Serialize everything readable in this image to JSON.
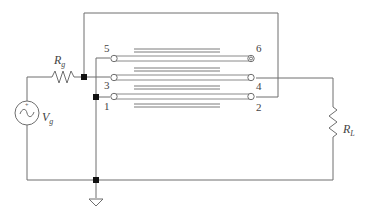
{
  "diagram": {
    "type": "transmission-line transformer circuit",
    "source": {
      "label": "V",
      "subscript": "g",
      "symbol": "ac-voltage-source"
    },
    "source_resistor": {
      "label": "R",
      "subscript": "g"
    },
    "load_resistor": {
      "label": "R",
      "subscript": "L"
    },
    "terminals": {
      "t1": "1",
      "t2": "2",
      "t3": "3",
      "t4": "4",
      "t5": "5",
      "t6": "6"
    },
    "ground": {
      "symbol": "ground"
    },
    "colors": {
      "wire": "#6e6e6e",
      "node": "#111111",
      "text": "#444444"
    }
  }
}
